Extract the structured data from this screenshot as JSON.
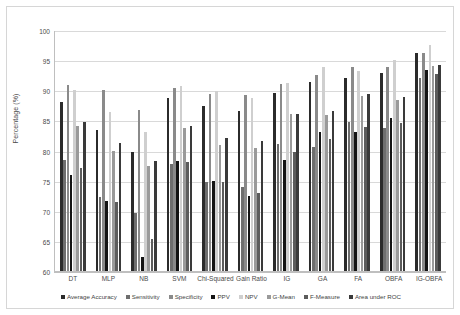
{
  "chart_data": {
    "type": "bar",
    "title": "",
    "subtitle": "",
    "xlabel": "",
    "ylabel": "Percentage (%)",
    "ylim": [
      60,
      100
    ],
    "ytick_step": 5,
    "yticks": [
      100,
      95,
      90,
      85,
      80,
      75,
      70,
      65,
      60
    ],
    "grid": true,
    "legend_position": "bottom",
    "categories": [
      "DT",
      "MLP",
      "NB",
      "SVM",
      "Chi-Squared",
      "Gain Ratio",
      "IG",
      "GA",
      "FA",
      "OBFA",
      "IG-OBFA"
    ],
    "series": [
      {
        "name": "Average Accuracy",
        "color": "#2b2b2b",
        "values": [
          88.1,
          83.4,
          79.7,
          88.7,
          87.4,
          86.5,
          89.5,
          91.4,
          92.0,
          92.9,
          96.2
        ]
      },
      {
        "name": "Sensitivity",
        "color": "#6e6e6e",
        "values": [
          78.5,
          72.3,
          69.6,
          77.8,
          74.7,
          74.0,
          81.1,
          80.6,
          84.8,
          83.8,
          92.0
        ]
      },
      {
        "name": "Specificity",
        "color": "#8a8a8a",
        "values": [
          90.9,
          90.1,
          86.8,
          90.3,
          89.3,
          89.2,
          91.1,
          92.5,
          93.9,
          93.8,
          96.2
        ]
      },
      {
        "name": "PPV",
        "color": "#141414",
        "values": [
          76.0,
          71.6,
          62.3,
          78.3,
          74.9,
          72.4,
          78.4,
          83.1,
          83.1,
          85.4,
          93.4
        ]
      },
      {
        "name": "NPV",
        "color": "#cfcfcf",
        "values": [
          90.0,
          86.4,
          83.1,
          90.7,
          89.8,
          88.7,
          91.2,
          93.8,
          93.2,
          95.0,
          97.5
        ]
      },
      {
        "name": "G-Mean",
        "color": "#9a9a9a",
        "values": [
          84.1,
          80.0,
          77.4,
          83.7,
          80.9,
          80.4,
          86.0,
          85.9,
          89.1,
          88.4,
          94.1
        ]
      },
      {
        "name": "F-Measure",
        "color": "#5c5c5c",
        "values": [
          77.1,
          71.4,
          65.3,
          78.1,
          74.7,
          73.0,
          79.8,
          81.9,
          83.9,
          84.6,
          92.7
        ]
      },
      {
        "name": "Area under ROC",
        "color": "#3a3a3a",
        "values": [
          84.8,
          81.2,
          78.3,
          84.0,
          82.1,
          81.6,
          86.1,
          86.6,
          89.3,
          88.8,
          94.2
        ]
      }
    ]
  }
}
